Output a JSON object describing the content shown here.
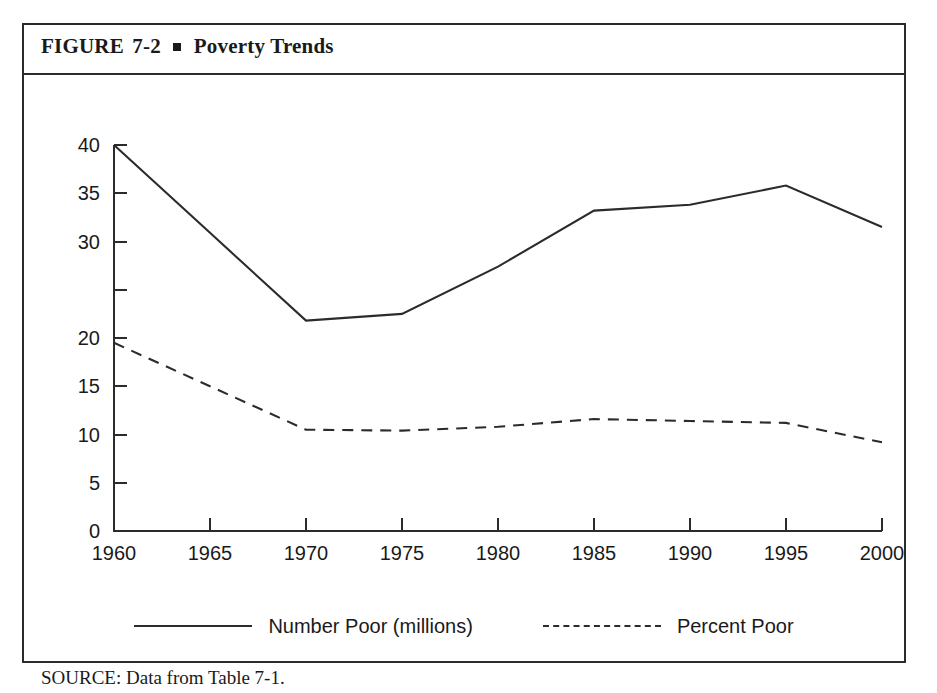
{
  "figure": {
    "label": "FIGURE",
    "number": "7-2",
    "separator_icon": "square-bullet",
    "title": "Poverty Trends",
    "source_note": "SOURCE: Data from Table 7-1."
  },
  "chart_data": {
    "type": "line",
    "title": "Poverty Trends",
    "xlabel": "",
    "ylabel": "",
    "x": [
      1960,
      1965,
      1970,
      1975,
      1980,
      1985,
      1990,
      1995,
      2000
    ],
    "xtick_labels": [
      "1960",
      "1965",
      "1970",
      "1975",
      "1980",
      "1985",
      "1990",
      "1995",
      "2000"
    ],
    "xlim": [
      1960,
      2000
    ],
    "ylim": [
      0,
      40
    ],
    "ytick_values": [
      40,
      35,
      30,
      25,
      20,
      15,
      10,
      5,
      0
    ],
    "ytick_labels": [
      "40",
      "35",
      "30",
      "20",
      "15",
      "10",
      "5",
      "0"
    ],
    "ytick_labels_note": "Printed axis omits the 25 label; ticks are evenly spaced every 5 units from 0 to 40.",
    "grid": false,
    "legend_position": "below-plot",
    "series": [
      {
        "name": "Number Poor (millions)",
        "style": "solid",
        "values": [
          40.0,
          30.9,
          21.8,
          22.5,
          27.4,
          33.2,
          33.8,
          35.8,
          31.5
        ]
      },
      {
        "name": "Percent Poor",
        "style": "dashed",
        "values": [
          19.5,
          15.0,
          10.5,
          10.4,
          10.8,
          11.6,
          11.4,
          11.2,
          9.2
        ]
      }
    ]
  },
  "legend": {
    "entries": [
      {
        "label": "Number Poor (millions)",
        "style": "solid"
      },
      {
        "label": "Percent Poor",
        "style": "dashed"
      }
    ]
  }
}
